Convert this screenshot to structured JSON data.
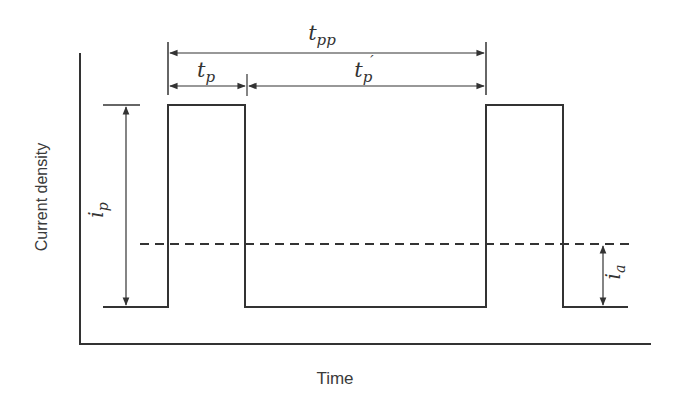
{
  "diagram": {
    "type": "pulse-current-waveform",
    "axes": {
      "xlabel": "Time",
      "ylabel": "Current density"
    },
    "annotations": {
      "period": "t",
      "period_sub": "pp",
      "on_time": "t",
      "on_time_sub": "p",
      "off_time": "t",
      "off_time_sub": "p",
      "off_time_prime": "′",
      "peak_current": "i",
      "peak_current_sub": "p",
      "average_current": "i",
      "average_current_sub": "a"
    },
    "colors": {
      "line": "#333333",
      "background": "#ffffff"
    }
  }
}
